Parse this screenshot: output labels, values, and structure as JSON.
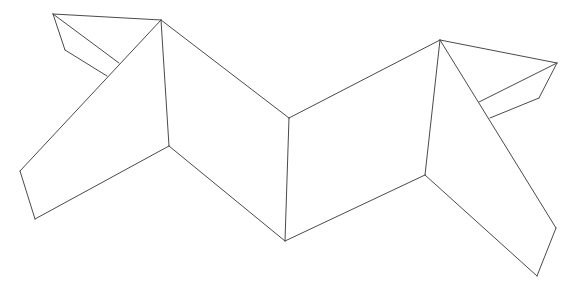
{
  "diagram": {
    "width": 578,
    "height": 291,
    "stroke_color": "#4a4a4a",
    "background": "#ffffff",
    "vertices": {
      "A": [
        53,
        14
      ],
      "B": [
        161,
        20
      ],
      "C": [
        65,
        50
      ],
      "D": [
        107,
        76
      ],
      "E": [
        119,
        63
      ],
      "F": [
        20,
        171
      ],
      "G": [
        35,
        219
      ],
      "H": [
        169,
        146
      ],
      "I": [
        289,
        118
      ],
      "J": [
        285,
        241
      ],
      "K": [
        440,
        40
      ],
      "L": [
        425,
        175
      ],
      "M": [
        557,
        63
      ],
      "N": [
        539,
        98
      ],
      "O": [
        490,
        118
      ],
      "P": [
        479,
        102
      ],
      "Q": [
        556,
        228
      ],
      "R": [
        537,
        276
      ]
    },
    "edges": [
      [
        "A",
        "B"
      ],
      [
        "A",
        "C"
      ],
      [
        "C",
        "D"
      ],
      [
        "A",
        "E"
      ],
      [
        "B",
        "F"
      ],
      [
        "F",
        "G"
      ],
      [
        "G",
        "H"
      ],
      [
        "B",
        "H"
      ],
      [
        "B",
        "I"
      ],
      [
        "I",
        "J"
      ],
      [
        "H",
        "J"
      ],
      [
        "I",
        "K"
      ],
      [
        "J",
        "L"
      ],
      [
        "K",
        "L"
      ],
      [
        "K",
        "M"
      ],
      [
        "M",
        "N"
      ],
      [
        "N",
        "O"
      ],
      [
        "M",
        "P"
      ],
      [
        "K",
        "Q"
      ],
      [
        "Q",
        "R"
      ],
      [
        "R",
        "L"
      ]
    ]
  }
}
